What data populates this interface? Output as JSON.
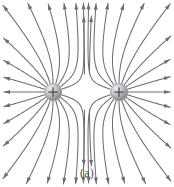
{
  "figure": {
    "caption": "(a)",
    "width": 174,
    "height": 187,
    "background_color": "#ffffff"
  },
  "style": {
    "field_line_color": "#6e6e72",
    "field_line_width": 1.05,
    "arrow_color": "#6e6e72",
    "arrow_length": 6.2,
    "arrow_half_width": 2.0,
    "charge_outline_color": "#8b8b90",
    "charge_fill_light": "#e6e6e8",
    "charge_fill_mid": "#b9b9bd",
    "charge_fill_dark": "#85858a",
    "charge_sign_color": "#4a4a4e",
    "caption_color": "#4a4a4a"
  },
  "chart_data": {
    "type": "scatter",
    "title": "",
    "subtitle": "",
    "xlabel": "",
    "ylabel": "",
    "xlim": [
      0,
      174
    ],
    "ylim": [
      0,
      187
    ],
    "grid": false,
    "legend": "none",
    "annotations": [
      {
        "text": "(a)",
        "x": 87,
        "y": 170,
        "role": "figure-caption"
      }
    ],
    "charges": [
      {
        "label": "+",
        "sign": 1,
        "magnitude": 1,
        "x": 53,
        "y": 92,
        "radius": 8.5
      },
      {
        "label": "+",
        "sign": 1,
        "magnitude": 1,
        "x": 119,
        "y": 92,
        "radius": 8.5
      }
    ],
    "field_lines": {
      "seeds_per_charge": 20,
      "start_angles_deg": [
        0,
        18,
        36,
        54,
        72,
        90,
        108,
        126,
        144,
        162,
        180,
        198,
        216,
        234,
        252,
        270,
        288,
        306,
        324,
        342
      ],
      "step": 1.05,
      "max_steps": 320,
      "arrowheads_per_line": 1,
      "arrow_at_end": true
    },
    "vertical_center_lines": [
      {
        "x": 84.5,
        "direction": "up",
        "from_y": 74,
        "to_y": 16
      },
      {
        "x": 89.5,
        "direction": "up",
        "from_y": 74,
        "to_y": 16
      },
      {
        "x": 84.5,
        "direction": "down",
        "from_y": 110,
        "to_y": 166
      },
      {
        "x": 89.5,
        "direction": "down",
        "from_y": 110,
        "to_y": 166
      }
    ]
  }
}
